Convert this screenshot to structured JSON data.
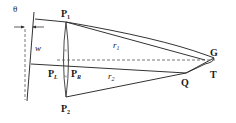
{
  "diagram": {
    "labels": {
      "theta": "θ",
      "w": "w",
      "p1_main": "P",
      "p1_sub": "1",
      "p2_main": "P",
      "p2_sub": "2",
      "pl_main": "P",
      "pl_sub": "L",
      "pr_main": "P",
      "pr_sub": "R",
      "r1_main": "r",
      "r1_sub": "1",
      "r2_main": "r",
      "r2_sub": "2",
      "g": "G",
      "t": "T",
      "q": "Q",
      "approx_top": "≈",
      "approx_bottom": "≈"
    },
    "colors": {
      "stroke": "#3a3a3a",
      "text": "#1a1a1a"
    }
  }
}
